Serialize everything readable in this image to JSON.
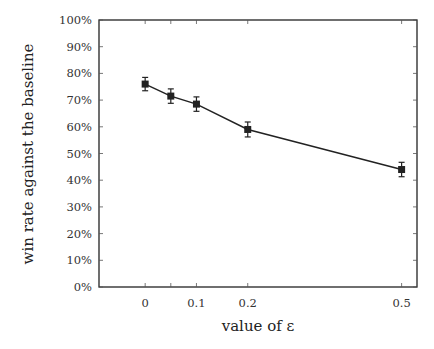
{
  "chart_data": {
    "type": "line",
    "title": "",
    "xlabel": "value of ε",
    "ylabel": "win rate against the baseline",
    "x": [
      0,
      0.05,
      0.1,
      0.2,
      0.5
    ],
    "series": [
      {
        "name": "win rate",
        "values": [
          76,
          71.5,
          68.5,
          59,
          44
        ],
        "errors": [
          2.5,
          2.7,
          2.7,
          2.8,
          2.7
        ],
        "marker": "square",
        "color": "#222222"
      }
    ],
    "xticks": [
      0,
      0.1,
      0.2,
      0.5
    ],
    "xtick_labels": [
      "0",
      "0.1",
      "0.2",
      "0.5"
    ],
    "yticks": [
      0,
      10,
      20,
      30,
      40,
      50,
      60,
      70,
      80,
      90,
      100
    ],
    "ytick_labels": [
      "0%",
      "10%",
      "20%",
      "30%",
      "40%",
      "50%",
      "60%",
      "70%",
      "80%",
      "90%",
      "100%"
    ],
    "xlim": [
      -0.09,
      0.53
    ],
    "ylim": [
      0,
      100
    ],
    "grid": false,
    "legend": "none"
  }
}
